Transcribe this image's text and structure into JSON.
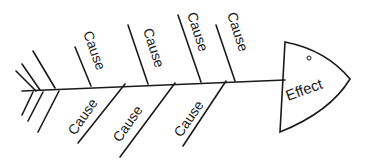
{
  "diagram": {
    "type": "fishbone",
    "effect": {
      "label": "Effect"
    },
    "upper_causes": [
      {
        "label": "Cause"
      },
      {
        "label": "Cause"
      },
      {
        "label": "Cause"
      },
      {
        "label": "Cause"
      }
    ],
    "lower_causes": [
      {
        "label": "Cause"
      },
      {
        "label": "Cause"
      },
      {
        "label": "Cause"
      }
    ],
    "colors": {
      "line": "#1a1a1a",
      "background": "#ffffff"
    }
  }
}
